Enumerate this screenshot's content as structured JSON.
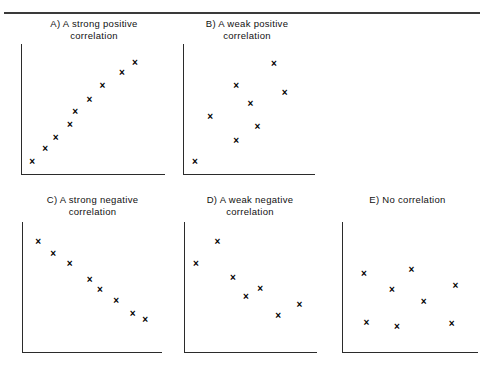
{
  "figure": {
    "rule_color": "#3a3a3a",
    "axis_color": "#2b2b2b",
    "marker_glyph": "×",
    "marker_symbol_name": "x-cross-marker"
  },
  "chart_data": [
    {
      "type": "scatter",
      "id": "panel-a",
      "title": "A) A strong positive\ncorrelation",
      "label": "A)",
      "caption": "A strong positive correlation",
      "xlabel": "",
      "ylabel": "",
      "xlim": [
        0,
        100
      ],
      "ylim": [
        0,
        100
      ],
      "grid": false,
      "legend": "none",
      "points": [
        {
          "x": 4,
          "y": 5
        },
        {
          "x": 14,
          "y": 16
        },
        {
          "x": 22,
          "y": 26
        },
        {
          "x": 33,
          "y": 37
        },
        {
          "x": 37,
          "y": 48
        },
        {
          "x": 48,
          "y": 59
        },
        {
          "x": 58,
          "y": 71
        },
        {
          "x": 73,
          "y": 82
        },
        {
          "x": 83,
          "y": 91
        }
      ]
    },
    {
      "type": "scatter",
      "id": "panel-b",
      "title": "B) A weak positive\ncorrelation",
      "label": "B)",
      "caption": "A weak positive correlation",
      "xlabel": "",
      "ylabel": "",
      "xlim": [
        0,
        100
      ],
      "ylim": [
        0,
        100
      ],
      "grid": false,
      "legend": "none",
      "points": [
        {
          "x": 5,
          "y": 5
        },
        {
          "x": 18,
          "y": 44
        },
        {
          "x": 40,
          "y": 23
        },
        {
          "x": 40,
          "y": 71
        },
        {
          "x": 52,
          "y": 55
        },
        {
          "x": 58,
          "y": 35
        },
        {
          "x": 72,
          "y": 90
        },
        {
          "x": 81,
          "y": 65
        }
      ]
    },
    {
      "type": "scatter",
      "id": "panel-c",
      "title": "C) A strong negative\ncorrelation",
      "label": "C)",
      "caption": "A strong negative correlation",
      "xlabel": "",
      "ylabel": "",
      "xlim": [
        0,
        100
      ],
      "ylim": [
        0,
        100
      ],
      "grid": false,
      "legend": "none",
      "points": [
        {
          "x": 8,
          "y": 90
        },
        {
          "x": 20,
          "y": 80
        },
        {
          "x": 33,
          "y": 71
        },
        {
          "x": 49,
          "y": 57
        },
        {
          "x": 57,
          "y": 48
        },
        {
          "x": 70,
          "y": 39
        },
        {
          "x": 83,
          "y": 27
        },
        {
          "x": 93,
          "y": 22
        }
      ]
    },
    {
      "type": "scatter",
      "id": "panel-d",
      "title": "D) A weak negative\ncorrelation",
      "label": "D)",
      "caption": "A weak negative correlation",
      "xlabel": "",
      "ylabel": "",
      "xlim": [
        0,
        100
      ],
      "ylim": [
        0,
        100
      ],
      "grid": false,
      "legend": "none",
      "points": [
        {
          "x": 5,
          "y": 71
        },
        {
          "x": 23,
          "y": 90
        },
        {
          "x": 36,
          "y": 59
        },
        {
          "x": 47,
          "y": 42
        },
        {
          "x": 59,
          "y": 49
        },
        {
          "x": 74,
          "y": 26
        },
        {
          "x": 92,
          "y": 35
        }
      ]
    },
    {
      "type": "scatter",
      "id": "panel-e",
      "title": "E) No correlation",
      "label": "E)",
      "caption": "No correlation",
      "xlabel": "",
      "ylabel": "",
      "xlim": [
        0,
        100
      ],
      "ylim": [
        0,
        100
      ],
      "grid": false,
      "legend": "none",
      "points": [
        {
          "x": 13,
          "y": 62
        },
        {
          "x": 15,
          "y": 20
        },
        {
          "x": 36,
          "y": 48
        },
        {
          "x": 40,
          "y": 16
        },
        {
          "x": 52,
          "y": 66
        },
        {
          "x": 62,
          "y": 38
        },
        {
          "x": 85,
          "y": 19
        },
        {
          "x": 88,
          "y": 52
        }
      ]
    }
  ]
}
